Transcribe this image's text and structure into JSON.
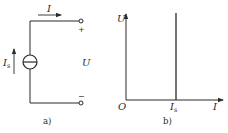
{
  "figure_a": {
    "caption": "a)",
    "current_label": "I",
    "source_label_main": "I",
    "source_label_sub": "s",
    "voltage_label": "U",
    "plus_sign": "+",
    "minus_sign": "−"
  },
  "figure_b": {
    "caption": "b)",
    "y_axis_label": "U",
    "x_axis_label": "I",
    "origin_label": "O",
    "tick_label_main": "I",
    "tick_label_sub": "s"
  },
  "colors": {
    "line": "#2a2a2a",
    "background": "#ffffff"
  }
}
